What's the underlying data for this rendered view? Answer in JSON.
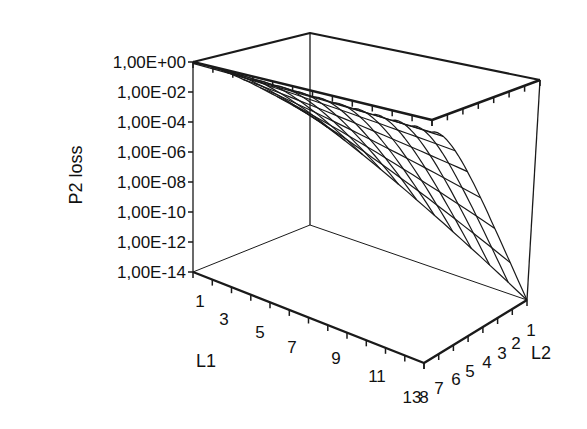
{
  "chart_data": {
    "type": "surface",
    "title": "",
    "zlabel": "P2 loss",
    "xlabel": "L1",
    "ylabel": "L2",
    "z_scale": "log",
    "z_ticks": [
      "1,00E+00",
      "1,00E-02",
      "1,00E-04",
      "1,00E-06",
      "1,00E-08",
      "1,00E-10",
      "1,00E-12",
      "1,00E-14"
    ],
    "zlim": [
      1e-14,
      1
    ],
    "x_ticks": [
      "1",
      "3",
      "5",
      "7",
      "9",
      "11",
      "13"
    ],
    "x_range": [
      1,
      13
    ],
    "y_ticks": [
      "8",
      "7",
      "6",
      "5",
      "4",
      "3",
      "2",
      "1"
    ],
    "y_range": [
      1,
      8
    ],
    "grid": false,
    "style": "wireframe",
    "surface_log10_corners": {
      "L1=1,L2=1": -0.1,
      "L1=1,L2=8": -6,
      "L1=13,L2=1": -0.7,
      "L1=13,L2=8": -14
    }
  },
  "labels": {
    "zaxis_title": "P2 loss",
    "xaxis_title": "L1",
    "yaxis_title": "L2",
    "x_overlap_label": "13"
  }
}
